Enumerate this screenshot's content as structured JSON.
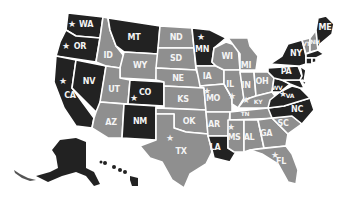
{
  "map": {
    "type": "US states choropleth",
    "colors": {
      "highlight": "#222222",
      "default": "#8f8f8f",
      "border": "#ffffff",
      "label": "#f4f4f4"
    },
    "legend_categories": [
      "dark",
      "gray"
    ],
    "states": [
      {
        "abbr": "WA",
        "shade": "dark",
        "star": true
      },
      {
        "abbr": "OR",
        "shade": "dark",
        "star": true
      },
      {
        "abbr": "CA",
        "shade": "dark",
        "star": true
      },
      {
        "abbr": "NV",
        "shade": "dark",
        "star": false
      },
      {
        "abbr": "ID",
        "shade": "gray",
        "star": false
      },
      {
        "abbr": "MT",
        "shade": "dark",
        "star": false
      },
      {
        "abbr": "WY",
        "shade": "gray",
        "star": false
      },
      {
        "abbr": "UT",
        "shade": "gray",
        "star": false
      },
      {
        "abbr": "CO",
        "shade": "dark",
        "star": true
      },
      {
        "abbr": "AZ",
        "shade": "gray",
        "star": false
      },
      {
        "abbr": "NM",
        "shade": "dark",
        "star": false
      },
      {
        "abbr": "ND",
        "shade": "gray",
        "star": false
      },
      {
        "abbr": "SD",
        "shade": "gray",
        "star": false
      },
      {
        "abbr": "NE",
        "shade": "gray",
        "star": false
      },
      {
        "abbr": "KS",
        "shade": "gray",
        "star": false
      },
      {
        "abbr": "OK",
        "shade": "gray",
        "star": false
      },
      {
        "abbr": "TX",
        "shade": "gray",
        "star": true
      },
      {
        "abbr": "MN",
        "shade": "dark",
        "star": true
      },
      {
        "abbr": "IA",
        "shade": "gray",
        "star": false
      },
      {
        "abbr": "MO",
        "shade": "gray",
        "star": true
      },
      {
        "abbr": "AR",
        "shade": "gray",
        "star": false
      },
      {
        "abbr": "LA",
        "shade": "dark",
        "star": false
      },
      {
        "abbr": "WI",
        "shade": "gray",
        "star": false
      },
      {
        "abbr": "IL",
        "shade": "gray",
        "star": true
      },
      {
        "abbr": "MI",
        "shade": "gray",
        "star": false
      },
      {
        "abbr": "IN",
        "shade": "gray",
        "star": false
      },
      {
        "abbr": "OH",
        "shade": "gray",
        "star": false
      },
      {
        "abbr": "KY",
        "shade": "gray",
        "star": true
      },
      {
        "abbr": "TN",
        "shade": "gray",
        "star": false
      },
      {
        "abbr": "MS",
        "shade": "gray",
        "star": true
      },
      {
        "abbr": "AL",
        "shade": "gray",
        "star": false
      },
      {
        "abbr": "GA",
        "shade": "gray",
        "star": false
      },
      {
        "abbr": "FL",
        "shade": "gray",
        "star": true
      },
      {
        "abbr": "SC",
        "shade": "gray",
        "star": false
      },
      {
        "abbr": "NC",
        "shade": "dark",
        "star": false
      },
      {
        "abbr": "VA",
        "shade": "dark",
        "star": true
      },
      {
        "abbr": "WV",
        "shade": "dark",
        "star": false
      },
      {
        "abbr": "PA",
        "shade": "dark",
        "star": false
      },
      {
        "abbr": "NY",
        "shade": "dark",
        "star": false
      },
      {
        "abbr": "VT",
        "shade": "gray",
        "star": false
      },
      {
        "abbr": "NH",
        "shade": "gray",
        "star": false
      },
      {
        "abbr": "ME",
        "shade": "dark",
        "star": false
      },
      {
        "abbr": "MA",
        "shade": "dark",
        "star": false
      },
      {
        "abbr": "CT",
        "shade": "dark",
        "star": false
      },
      {
        "abbr": "RI",
        "shade": "dark",
        "star": false
      },
      {
        "abbr": "NJ",
        "shade": "dark",
        "star": false
      },
      {
        "abbr": "DE",
        "shade": "dark",
        "star": false
      },
      {
        "abbr": "MD",
        "shade": "dark",
        "star": false
      },
      {
        "abbr": "AK",
        "shade": "dark",
        "star": false
      },
      {
        "abbr": "HI",
        "shade": "dark",
        "star": false
      }
    ],
    "labels": {
      "WA": "WA",
      "OR": "OR",
      "CA": "CA",
      "NV": "NV",
      "ID": "ID",
      "MT": "MT",
      "WY": "WY",
      "UT": "UT",
      "CO": "CO",
      "AZ": "AZ",
      "NM": "NM",
      "ND": "ND",
      "SD": "SD",
      "NE": "NE",
      "KS": "KS",
      "OK": "OK",
      "TX": "TX",
      "MN": "MN",
      "IA": "IA",
      "MO": "MO",
      "AR": "AR",
      "LA": "LA",
      "WI": "WI",
      "IL": "IL",
      "MI": "MI",
      "IN": "IN",
      "OH": "OH",
      "KY": "KY",
      "TN": "TN",
      "MS": "MS",
      "AL": "AL",
      "GA": "GA",
      "FL": "FL",
      "SC": "SC",
      "NC": "NC",
      "VA": "VA",
      "WV": "WV",
      "PA": "PA",
      "NY": "NY",
      "VT": "VT",
      "NH": "NH",
      "ME": "ME"
    },
    "star_glyph": "★"
  }
}
